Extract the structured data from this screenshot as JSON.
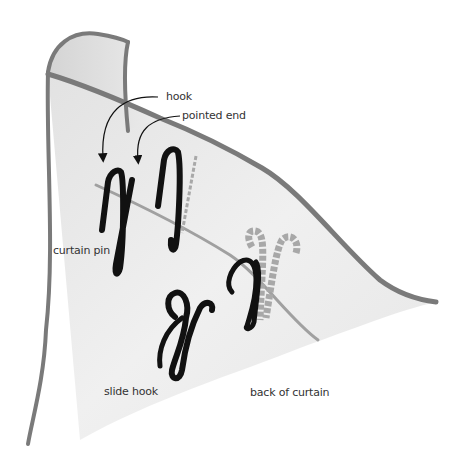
{
  "diagram": {
    "type": "illustration",
    "labels": {
      "hook": "hook",
      "pointed_end": "pointed end",
      "curtain_pin": "curtain pin",
      "slide_hook": "slide hook",
      "back_of_curtain": "back of curtain"
    },
    "colors": {
      "fabric_fill": "#ebebeb",
      "fabric_edge": "#7a7a7a",
      "heading_tape_line": "#9a9a9a",
      "hook_black": "#111111",
      "hidden_hook_gray": "#a8a8a8",
      "label_text": "#333333"
    }
  }
}
